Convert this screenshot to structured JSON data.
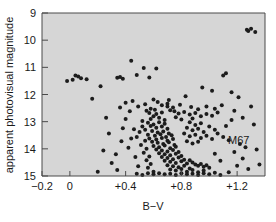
{
  "chart_data": {
    "type": "scatter",
    "title": "",
    "xlabel": "B−V",
    "ylabel": "apparent photovisual magnitude",
    "annotation": "M67",
    "xlim": [
      -0.2,
      1.4
    ],
    "ylim": [
      15,
      9
    ],
    "y_inverted": true,
    "grid": false,
    "legend": "none",
    "xticks": [
      -0.2,
      0.0,
      0.4,
      0.8,
      1.2
    ],
    "xticklabels": [
      "−0.2",
      "0",
      "+0.4",
      "+0.8",
      "+1.2"
    ],
    "yticks": [
      9,
      10,
      11,
      12,
      13,
      14,
      15
    ],
    "yticklabels": [
      "9",
      "10",
      "11",
      "12",
      "13",
      "14",
      "15"
    ],
    "marker": "dot",
    "marker_color": "#1c1c1c",
    "marker_size": 2.0,
    "panel_color": "#d6d6d6",
    "axis_color": "#4a4a4a",
    "points": [
      [
        0.44,
        10.76
      ],
      [
        0.53,
        11.02
      ],
      [
        0.62,
        11.04
      ],
      [
        0.48,
        11.28
      ],
      [
        0.34,
        11.38
      ],
      [
        0.36,
        11.36
      ],
      [
        0.38,
        11.42
      ],
      [
        0.57,
        11.37
      ],
      [
        1.12,
        11.22
      ],
      [
        1.1,
        11.3
      ],
      [
        0.95,
        11.74
      ],
      [
        1.02,
        11.86
      ],
      [
        1.16,
        11.92
      ],
      [
        0.83,
        12.06
      ],
      [
        1.21,
        12.1
      ],
      [
        0.6,
        12.18
      ],
      [
        0.45,
        12.24
      ],
      [
        0.7,
        12.34
      ],
      [
        1.27,
        9.62
      ],
      [
        1.3,
        9.58
      ],
      [
        1.33,
        9.7
      ],
      [
        1.28,
        9.66
      ],
      [
        0.36,
        12.48
      ],
      [
        0.58,
        12.52
      ],
      [
        0.7,
        12.44
      ],
      [
        0.72,
        12.58
      ],
      [
        0.66,
        12.66
      ],
      [
        0.62,
        12.72
      ],
      [
        0.6,
        12.8
      ],
      [
        0.64,
        12.86
      ],
      [
        0.58,
        12.9
      ],
      [
        0.68,
        12.94
      ],
      [
        0.55,
        12.6
      ],
      [
        0.57,
        12.68
      ],
      [
        0.61,
        12.56
      ],
      [
        0.75,
        12.62
      ],
      [
        0.78,
        12.7
      ],
      [
        0.82,
        12.64
      ],
      [
        0.86,
        12.74
      ],
      [
        0.9,
        12.68
      ],
      [
        0.94,
        12.8
      ],
      [
        0.88,
        12.88
      ],
      [
        0.8,
        12.92
      ],
      [
        0.76,
        12.84
      ],
      [
        0.98,
        12.72
      ],
      [
        1.02,
        12.78
      ],
      [
        1.06,
        12.66
      ],
      [
        1.18,
        12.6
      ],
      [
        0.52,
        12.98
      ],
      [
        0.56,
        13.04
      ],
      [
        0.6,
        13.1
      ],
      [
        0.64,
        13.02
      ],
      [
        0.68,
        13.08
      ],
      [
        0.58,
        13.16
      ],
      [
        0.62,
        13.22
      ],
      [
        0.66,
        13.18
      ],
      [
        0.7,
        13.26
      ],
      [
        0.54,
        13.3
      ],
      [
        0.59,
        13.34
      ],
      [
        0.63,
        13.4
      ],
      [
        0.67,
        13.36
      ],
      [
        0.71,
        13.44
      ],
      [
        0.56,
        13.48
      ],
      [
        0.61,
        13.52
      ],
      [
        0.65,
        13.46
      ],
      [
        0.69,
        13.56
      ],
      [
        0.73,
        13.5
      ],
      [
        0.57,
        13.62
      ],
      [
        0.62,
        13.66
      ],
      [
        0.66,
        13.6
      ],
      [
        0.7,
        13.7
      ],
      [
        0.74,
        13.64
      ],
      [
        0.59,
        13.74
      ],
      [
        0.63,
        13.78
      ],
      [
        0.67,
        13.82
      ],
      [
        0.71,
        13.76
      ],
      [
        0.75,
        13.86
      ],
      [
        0.6,
        13.9
      ],
      [
        0.64,
        13.94
      ],
      [
        0.68,
        13.88
      ],
      [
        0.72,
        13.98
      ],
      [
        0.76,
        13.92
      ],
      [
        0.62,
        14.02
      ],
      [
        0.66,
        14.06
      ],
      [
        0.7,
        14.1
      ],
      [
        0.74,
        14.04
      ],
      [
        0.78,
        14.12
      ],
      [
        0.64,
        14.16
      ],
      [
        0.68,
        14.2
      ],
      [
        0.72,
        14.24
      ],
      [
        0.76,
        14.18
      ],
      [
        0.8,
        14.26
      ],
      [
        0.66,
        14.3
      ],
      [
        0.7,
        14.34
      ],
      [
        0.74,
        14.38
      ],
      [
        0.78,
        14.32
      ],
      [
        0.82,
        14.4
      ],
      [
        0.68,
        14.44
      ],
      [
        0.72,
        14.48
      ],
      [
        0.76,
        14.52
      ],
      [
        0.8,
        14.46
      ],
      [
        0.84,
        14.54
      ],
      [
        0.86,
        14.42
      ],
      [
        0.88,
        14.5
      ],
      [
        0.9,
        14.58
      ],
      [
        0.92,
        14.62
      ],
      [
        0.94,
        14.56
      ],
      [
        0.96,
        14.66
      ],
      [
        0.98,
        14.6
      ],
      [
        1.0,
        14.7
      ],
      [
        0.7,
        14.6
      ],
      [
        0.74,
        14.64
      ],
      [
        0.78,
        14.68
      ],
      [
        0.82,
        14.62
      ],
      [
        0.86,
        14.72
      ],
      [
        0.72,
        14.76
      ],
      [
        0.76,
        14.8
      ],
      [
        0.8,
        14.74
      ],
      [
        0.84,
        14.84
      ],
      [
        0.88,
        14.78
      ],
      [
        0.92,
        14.86
      ],
      [
        0.96,
        14.8
      ],
      [
        0.52,
        13.18
      ],
      [
        0.5,
        13.38
      ],
      [
        0.48,
        13.56
      ],
      [
        0.54,
        13.7
      ],
      [
        0.51,
        13.86
      ],
      [
        0.55,
        14.0
      ],
      [
        0.53,
        14.14
      ],
      [
        0.57,
        14.28
      ],
      [
        0.55,
        14.42
      ],
      [
        0.58,
        14.56
      ],
      [
        0.56,
        14.7
      ],
      [
        0.6,
        14.84
      ],
      [
        0.46,
        13.28
      ],
      [
        0.44,
        13.62
      ],
      [
        0.42,
        13.96
      ],
      [
        0.47,
        14.3
      ],
      [
        0.49,
        14.64
      ],
      [
        0.86,
        13.02
      ],
      [
        0.9,
        13.12
      ],
      [
        0.94,
        13.06
      ],
      [
        0.84,
        13.22
      ],
      [
        0.88,
        13.32
      ],
      [
        0.92,
        13.26
      ],
      [
        0.96,
        13.38
      ],
      [
        1.0,
        13.18
      ],
      [
        1.04,
        13.3
      ],
      [
        0.82,
        13.44
      ],
      [
        0.86,
        13.54
      ],
      [
        0.9,
        13.48
      ],
      [
        0.94,
        13.6
      ],
      [
        0.98,
        13.52
      ],
      [
        1.02,
        13.64
      ],
      [
        0.84,
        13.72
      ],
      [
        0.88,
        13.8
      ],
      [
        0.92,
        13.74
      ],
      [
        1.06,
        13.44
      ],
      [
        1.1,
        13.56
      ],
      [
        1.14,
        13.68
      ],
      [
        0.26,
        12.86
      ],
      [
        0.28,
        13.44
      ],
      [
        0.24,
        14.06
      ],
      [
        0.3,
        14.52
      ],
      [
        0.34,
        14.78
      ],
      [
        0.2,
        14.84
      ],
      [
        0.38,
        13.24
      ],
      [
        0.4,
        12.3
      ],
      [
        0.16,
        12.16
      ],
      [
        0.12,
        11.44
      ],
      [
        0.04,
        11.3
      ],
      [
        0.06,
        11.34
      ],
      [
        0.08,
        11.4
      ],
      [
        0.02,
        11.46
      ],
      [
        -0.02,
        11.5
      ],
      [
        0.22,
        11.7
      ],
      [
        1.22,
        13.82
      ],
      [
        1.26,
        13.94
      ],
      [
        1.18,
        14.12
      ],
      [
        1.24,
        14.36
      ],
      [
        1.2,
        14.62
      ],
      [
        1.28,
        14.74
      ],
      [
        1.14,
        14.86
      ],
      [
        1.08,
        14.44
      ],
      [
        1.04,
        14.18
      ],
      [
        1.12,
        13.16
      ],
      [
        1.16,
        12.94
      ],
      [
        1.24,
        12.86
      ],
      [
        1.3,
        12.44
      ],
      [
        1.32,
        13.1
      ],
      [
        1.34,
        14.02
      ],
      [
        1.36,
        14.58
      ],
      [
        0.64,
        14.9
      ],
      [
        0.68,
        14.94
      ],
      [
        0.72,
        14.92
      ],
      [
        0.76,
        14.96
      ],
      [
        0.8,
        14.9
      ],
      [
        0.84,
        14.94
      ],
      [
        0.88,
        14.92
      ],
      [
        0.92,
        14.96
      ],
      [
        0.6,
        14.94
      ],
      [
        0.96,
        14.9
      ],
      [
        1.0,
        14.94
      ],
      [
        1.04,
        14.88
      ],
      [
        0.56,
        14.9
      ],
      [
        0.52,
        14.96
      ],
      [
        0.48,
        14.92
      ],
      [
        1.08,
        14.96
      ],
      [
        0.66,
        12.4
      ],
      [
        0.74,
        12.48
      ],
      [
        0.79,
        12.38
      ],
      [
        0.87,
        12.46
      ],
      [
        0.92,
        12.54
      ],
      [
        0.98,
        12.44
      ],
      [
        1.04,
        12.52
      ],
      [
        1.09,
        12.4
      ],
      [
        0.63,
        12.28
      ],
      [
        0.71,
        12.2
      ],
      [
        0.54,
        12.36
      ],
      [
        0.49,
        12.44
      ],
      [
        0.43,
        12.62
      ],
      [
        0.4,
        12.9
      ],
      [
        0.37,
        13.72
      ],
      [
        0.33,
        14.2
      ]
    ]
  }
}
